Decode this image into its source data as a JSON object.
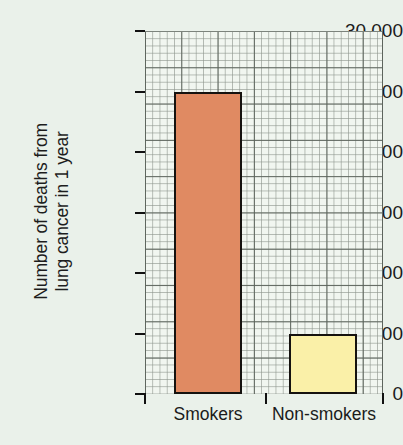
{
  "chart_data": {
    "type": "bar",
    "title": "",
    "subtitle": "",
    "xlabel": "",
    "ylabel": "Number of deaths from lung cancer in 1 year",
    "ylabel_lines": [
      "Number of deaths from",
      "lung cancer in 1 year"
    ],
    "categories": [
      "Smokers",
      "Non-smokers"
    ],
    "values": [
      25000,
      5000
    ],
    "series": [
      {
        "name": "Number of deaths from lung cancer in 1 year",
        "values": [
          25000,
          5000
        ]
      }
    ],
    "bar_colors": [
      "#e08a62",
      "#faf0a8"
    ],
    "bar_edge_color": "#15120f",
    "ylim": [
      0,
      30000
    ],
    "ytick_values": [
      0,
      5000,
      10000,
      15000,
      20000,
      25000,
      30000
    ],
    "ytick_labels": [
      "0",
      "5000",
      "10 000",
      "15 000",
      "20 000",
      "25 000",
      "30 000"
    ],
    "grid": true,
    "grid_style": "graph-paper",
    "grid_minor_step": 500,
    "grid_major_step": 2500,
    "legend": false,
    "legend_position": "none",
    "background_color": "#eaf1ea",
    "plot_background_color": "#f1f6f0",
    "axis_color": "#111111",
    "text_color": "#1b1b1b"
  },
  "axes": {
    "y": {
      "ticks": [
        {
          "label": "30 000",
          "value": 30000
        },
        {
          "label": "25 000",
          "value": 25000
        },
        {
          "label": "20 000",
          "value": 20000
        },
        {
          "label": "15 000",
          "value": 15000
        },
        {
          "label": "10 000",
          "value": 10000
        },
        {
          "label": "5000",
          "value": 5000
        },
        {
          "label": "0",
          "value": 0
        }
      ]
    },
    "x": {
      "ticks": [
        {
          "label": "Smokers"
        },
        {
          "label": "Non-smokers"
        }
      ]
    }
  },
  "bars": [
    {
      "category": "Smokers",
      "value": 25000,
      "color": "#e08a62"
    },
    {
      "category": "Non-smokers",
      "value": 5000,
      "color": "#faf0a8"
    }
  ]
}
